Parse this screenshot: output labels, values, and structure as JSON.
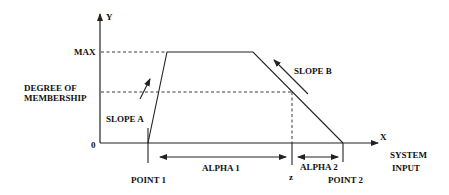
{
  "diagram": {
    "type": "fuzzy-membership-trapezoid",
    "axes": {
      "y_label": "Y",
      "x_label": "X",
      "y_max_label": "MAX",
      "y_zero_label": "0",
      "y_title_line1": "DEGREE OF",
      "y_title_line2": "MEMBERSHIP",
      "x_title_line1": "SYSTEM",
      "x_title_line2": "INPUT"
    },
    "slopes": {
      "a": "SLOPE A",
      "b": "SLOPE B"
    },
    "points": {
      "p1": "POINT 1",
      "p2": "POINT 2",
      "z": "z"
    },
    "intervals": {
      "alpha1": "ALPHA 1",
      "alpha2": "ALPHA 2"
    }
  }
}
